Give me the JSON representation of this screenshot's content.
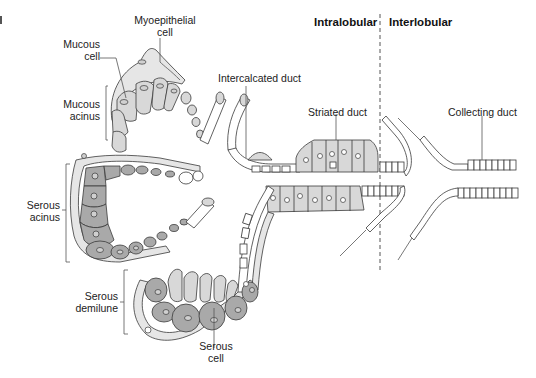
{
  "figure": {
    "type": "salivary gland duct system schematic",
    "corner_fragment": "d",
    "regions": {
      "intralobular": "Intralobular",
      "interlobular": "Interlobular"
    },
    "labels": {
      "myoepithelial_cell": [
        "Myoepithelial",
        "cell"
      ],
      "mucous_cell": [
        "Mucous",
        "cell"
      ],
      "mucous_acinus": [
        "Mucous",
        "acinus"
      ],
      "intercalated_duct": "Intercalcated duct",
      "striated_duct": "Striated duct",
      "collecting_duct": "Collecting duct",
      "serous_acinus": [
        "Serous",
        "acinus"
      ],
      "serous_demilune": [
        "Serous",
        "demilune"
      ],
      "serous_cell": [
        "Serous",
        "cell"
      ]
    },
    "colors": {
      "serous_cell_fill": "#a9a9a9",
      "mucous_cell_fill": "#d8d8d8",
      "myoepithelial_fill": "#e4e4e4",
      "duct_cell_fill": "#ffffff",
      "outline": "#3a3a3a",
      "leader_line": "#555555"
    }
  }
}
